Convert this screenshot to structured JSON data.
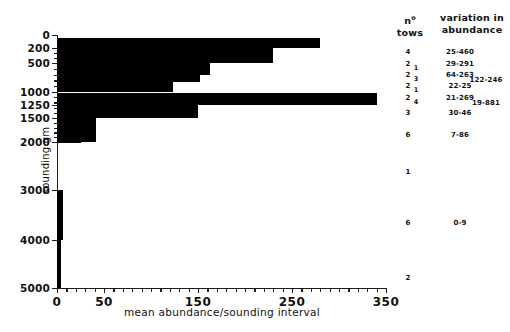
{
  "chart_data": {
    "type": "bar",
    "orientation": "horizontal",
    "title": "",
    "xlabel": "mean abundance/sounding interval",
    "ylabel": "sounding gm",
    "xlim": [
      0,
      350
    ],
    "xticks": [
      0,
      50,
      150,
      250,
      350
    ],
    "xticks_labeled": [
      "0",
      "50",
      "150",
      "250",
      "350"
    ],
    "xminor_step": 10,
    "grid": false,
    "legend": "none",
    "yaxis_note": "depth bands in metres, irregular (non-linear) spacing",
    "ydepth_breaks": [
      0,
      200,
      500,
      1000,
      1250,
      1500,
      2000,
      3000,
      4000,
      5000
    ],
    "ytick_labels": [
      "0",
      "200",
      "500",
      "1000",
      "1250",
      "1500",
      "2000",
      "3000",
      "4000",
      "5000"
    ],
    "categories": [
      "0-200",
      "200-500",
      "500-700",
      "700-800",
      "800-1000",
      "1000-1250",
      "1250-1500",
      "1500-2000",
      "2000-3000",
      "3000-4000",
      "4000-5000"
    ],
    "values": [
      280,
      230,
      163,
      152,
      123,
      340,
      150,
      42,
      25,
      6,
      4
    ],
    "bars": [
      {
        "band": "0-200",
        "value": 280,
        "top_m": 20,
        "bottom_m": 200
      },
      {
        "band": "200-500",
        "value": 230,
        "top_m": 200,
        "bottom_m": 500
      },
      {
        "band": "500-700",
        "value": 163,
        "top_m": 500,
        "bottom_m": 640
      },
      {
        "band": "700-800",
        "value": 152,
        "top_m": 640,
        "bottom_m": 760
      },
      {
        "band": "800-1000",
        "value": 123,
        "top_m": 760,
        "bottom_m": 940
      },
      {
        "band": "1000-1250",
        "value": 340,
        "top_m": 960,
        "bottom_m": 1250
      },
      {
        "band": "1250-1500",
        "value": 150,
        "top_m": 1250,
        "bottom_m": 1470
      },
      {
        "band": "1500-2000",
        "value": 42,
        "top_m": 1470,
        "bottom_m": 2000
      },
      {
        "band": "2000-3000",
        "value": 25,
        "top_m": 2000,
        "bottom_m": 2000
      },
      {
        "band": "3000-4000",
        "value": 6,
        "top_m": 3000,
        "bottom_m": 4000
      },
      {
        "band": "4000-5000",
        "value": 4,
        "top_m": 4000,
        "bottom_m": 5000
      }
    ]
  },
  "side_table": {
    "headers": {
      "tows_line1": "n",
      "tows_sup": "o",
      "tows_line2": "tows",
      "variation_line1": "variation in",
      "variation_line2": "abundance"
    },
    "rows": [
      {
        "tows": "4",
        "subtows": "",
        "variation": "25-460",
        "variation2": ""
      },
      {
        "tows": "2",
        "subtows": "1",
        "variation": "29-291",
        "variation2": ""
      },
      {
        "tows": "2",
        "subtows": "3",
        "variation": "64-263",
        "variation2": "122-246"
      },
      {
        "tows": "2",
        "subtows": "1",
        "variation": "22-25",
        "variation2": ""
      },
      {
        "tows": "2",
        "subtows": "4",
        "variation": "21-269",
        "variation2": "19-881"
      },
      {
        "tows": "3",
        "subtows": "",
        "variation": "30-46",
        "variation2": ""
      },
      {
        "tows": "6",
        "subtows": "",
        "variation": "7-86",
        "variation2": ""
      },
      {
        "tows": "1",
        "subtows": "",
        "variation": "",
        "variation2": ""
      },
      {
        "tows": "6",
        "subtows": "",
        "variation": "0-9",
        "variation2": ""
      },
      {
        "tows": "2",
        "subtows": "",
        "variation": "",
        "variation2": ""
      }
    ]
  },
  "colors": {
    "bar": "#000000",
    "axis": "#1a1a1a",
    "background": "#ffffff",
    "text": "#111111"
  }
}
